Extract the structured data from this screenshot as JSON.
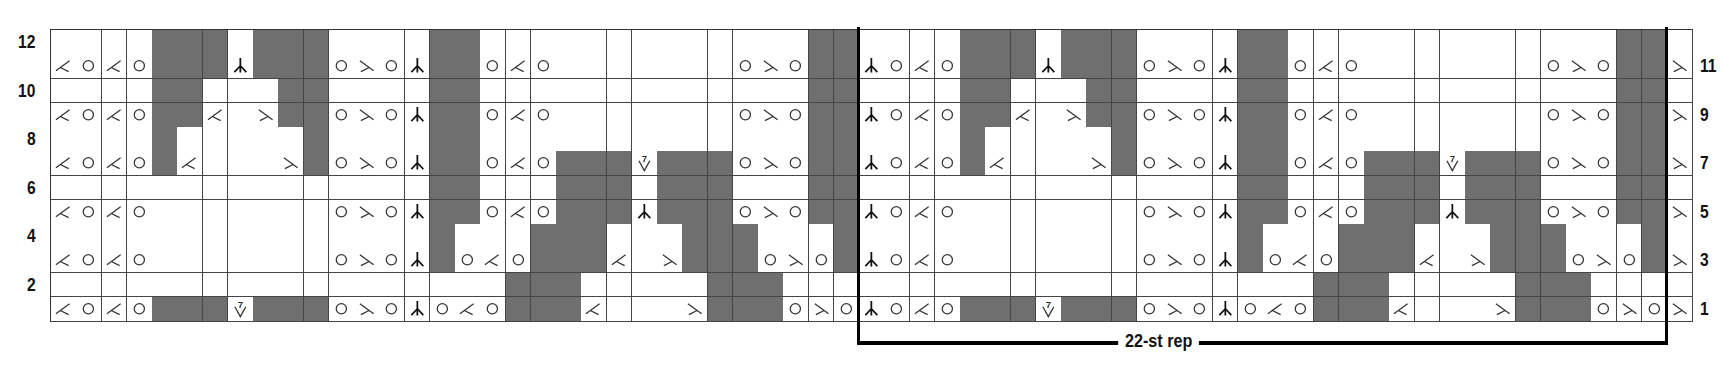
{
  "chart_data": {
    "type": "table",
    "columns": 65,
    "rows": 12,
    "legend": {
      "_": "blank (knit)",
      "G": "gray shaded square",
      "O": "yarn over (circle)",
      "L": "left-leaning decrease symbol",
      "R": "right-leaning decrease symbol",
      "C": "centered double decrease (arrow up)",
      "V": "7-into-1 symbol (V with 7)"
    },
    "grid_rows_top_to_bottom": [
      {
        "row": 12,
        "cells": "____GGG_GGG____GG_____________GG____GGG_GGG____GG_____________GG_"
      },
      {
        "row": 11,
        "cells": "LOLOGGGCGGGOROCGGOLO_______OROGGCOLOGGGCGGGOROCGGOLO_______OROGGR"
      },
      {
        "row": 10,
        "cells": "____GG___GG____GG_____________GG____GG___GG____GG_____________GG_"
      },
      {
        "row": 9,
        "cells": "LOLOGGL_RGGOROCGGOLO_______OROGGCOLOGGL_RGGOROCGGOLO_______OROGGR"
      },
      {
        "row": 8,
        "cells": "____G_____G____GG_____________GG____G_____G____GG_____________GG_"
      },
      {
        "row": 7,
        "cells": "LOLOGL___RGOROCGGOLOGGGVGGGOROGGCOLOGL___RGOROCGGOLOGGGVGGGOROGGR"
      },
      {
        "row": 6,
        "cells": "_______________GG___GGG_GGG___GG_______________GG___GGG_GGG___GG_"
      },
      {
        "row": 5,
        "cells": "LOLO_______OROCGGOLOGGGCGGGOROGGCOLO_______OROCGGOLOGGGCGGGOROGGR"
      },
      {
        "row": 4,
        "cells": "_______________G___GGG___GGG___G_______________G___GGG___GGG___G_"
      },
      {
        "row": 3,
        "cells": "LOLO_______OROCGOLOGGGL_RGGGOROGCOLO_______OROCGOLOGGGL_RGGGOROGR"
      },
      {
        "row": 2,
        "cells": "__________________GGG_____GGG_____________________GGG_____GGG____"
      },
      {
        "row": 1,
        "cells": "LOLOGGGVGGGOROCOLOGGGL___RGGGOROCOLOGGGVGGGOROCOLOGGGL___RGGGOROR"
      }
    ],
    "left_row_labels": [
      "12",
      "10",
      "8",
      "6",
      "4",
      "2"
    ],
    "right_row_labels": [
      "11",
      "9",
      "7",
      "5",
      "3",
      "1"
    ],
    "repeat": {
      "label": "22-st rep",
      "start_col": 33,
      "end_col": 64
    }
  },
  "labels": {
    "rep": "22-st rep"
  }
}
